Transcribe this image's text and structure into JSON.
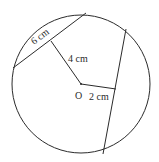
{
  "diagram": {
    "title": "",
    "labels": {
      "chord_length": "6 cm",
      "distance_chord1": "4 cm",
      "center": "O",
      "distance_chord2": "2 cm"
    },
    "circle": {
      "cx": 81,
      "cy": 84,
      "r": 69
    },
    "chord1": {
      "x1": 13,
      "y1": 68,
      "x2": 86,
      "y2": 13
    },
    "perp1": {
      "x1": 81,
      "y1": 84,
      "x2": 51,
      "y2": 41
    },
    "chord2": {
      "x1": 126,
      "y1": 29,
      "x2": 103,
      "y2": 154
    },
    "perp2": {
      "x1": 81,
      "y1": 84,
      "x2": 116,
      "y2": 89
    },
    "stroke_color": "#2b2b2b"
  }
}
